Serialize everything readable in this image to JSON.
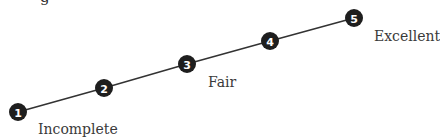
{
  "diagram": {
    "type": "rating-scale",
    "line_color": "#333333",
    "node_color": "#1e1e1e",
    "node_text_color": "#ffffff",
    "cut_text": "g",
    "nodes": [
      {
        "label": "1",
        "x": 18,
        "y": 112
      },
      {
        "label": "2",
        "x": 104,
        "y": 88
      },
      {
        "label": "3",
        "x": 187,
        "y": 64
      },
      {
        "label": "4",
        "x": 270,
        "y": 41
      },
      {
        "label": "5",
        "x": 354,
        "y": 18
      }
    ],
    "anchors": [
      {
        "text": "Incomplete",
        "for": "1"
      },
      {
        "text": "Fair",
        "for": "3"
      },
      {
        "text": "Excellent",
        "for": "5"
      }
    ]
  }
}
